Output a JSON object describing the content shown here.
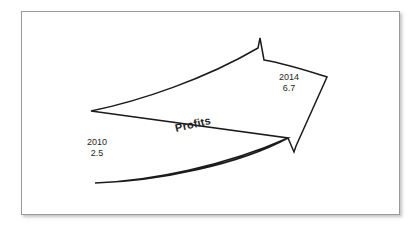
{
  "diagram": {
    "type": "curved-arrow-growth",
    "series_label": "Profits",
    "background_color": "#ffffff",
    "frame_border_color": "#9a9a9a",
    "arrow_stroke_color": "#1b1b1b",
    "arrow_fill_color": "#ffffff",
    "text_color": "#1f1f1f",
    "start_point": {
      "year": "2010",
      "value": "2.5"
    },
    "end_point": {
      "year": "2014",
      "value": "6.7"
    }
  }
}
